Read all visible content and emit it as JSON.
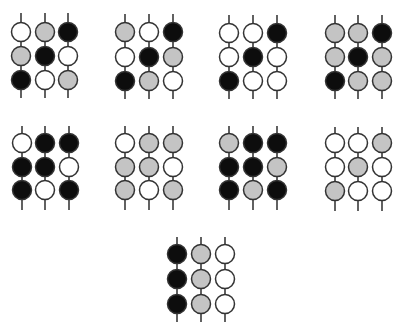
{
  "diagram": {
    "type": "bead-pattern-grid",
    "legend": {
      "W": {
        "name": "white",
        "color": "#ffffff"
      },
      "G": {
        "name": "gray",
        "color": "#c4c4c4"
      },
      "B": {
        "name": "black",
        "color": "#0d0d0d"
      }
    },
    "outline_color": "#333333",
    "bead_radius": 9.5,
    "panels": [
      {
        "id": 1,
        "x": [
          21,
          45,
          68
        ],
        "y": [
          32,
          56,
          80
        ],
        "rod": [
          13,
          98
        ],
        "rows": [
          [
            "W",
            "G",
            "B"
          ],
          [
            "G",
            "B",
            "W"
          ],
          [
            "B",
            "W",
            "G"
          ]
        ]
      },
      {
        "id": 2,
        "x": [
          125,
          149,
          173
        ],
        "y": [
          32,
          57,
          81
        ],
        "rod": [
          14,
          99
        ],
        "rows": [
          [
            "G",
            "W",
            "B"
          ],
          [
            "W",
            "B",
            "G"
          ],
          [
            "B",
            "G",
            "W"
          ]
        ]
      },
      {
        "id": 3,
        "x": [
          229,
          253,
          277
        ],
        "y": [
          33,
          57,
          81
        ],
        "rod": [
          15,
          99
        ],
        "rows": [
          [
            "W",
            "W",
            "B"
          ],
          [
            "W",
            "B",
            "W"
          ],
          [
            "B",
            "W",
            "W"
          ]
        ]
      },
      {
        "id": 4,
        "x": [
          335,
          358,
          382
        ],
        "y": [
          33,
          57,
          81
        ],
        "rod": [
          15,
          99
        ],
        "rows": [
          [
            "G",
            "G",
            "B"
          ],
          [
            "G",
            "B",
            "G"
          ],
          [
            "B",
            "G",
            "G"
          ]
        ]
      },
      {
        "id": 5,
        "x": [
          22,
          45,
          69
        ],
        "y": [
          143,
          167,
          190
        ],
        "rod": [
          126,
          210
        ],
        "rows": [
          [
            "W",
            "B",
            "B"
          ],
          [
            "B",
            "B",
            "W"
          ],
          [
            "B",
            "W",
            "B"
          ]
        ]
      },
      {
        "id": 6,
        "x": [
          125,
          149,
          173
        ],
        "y": [
          143,
          167,
          190
        ],
        "rod": [
          126,
          210
        ],
        "rows": [
          [
            "W",
            "G",
            "G"
          ],
          [
            "G",
            "G",
            "W"
          ],
          [
            "G",
            "W",
            "G"
          ]
        ]
      },
      {
        "id": 7,
        "x": [
          229,
          253,
          277
        ],
        "y": [
          143,
          167,
          190
        ],
        "rod": [
          126,
          210
        ],
        "rows": [
          [
            "G",
            "B",
            "B"
          ],
          [
            "B",
            "B",
            "G"
          ],
          [
            "B",
            "G",
            "B"
          ]
        ]
      },
      {
        "id": 8,
        "x": [
          335,
          358,
          382
        ],
        "y": [
          143,
          167,
          191
        ],
        "rod": [
          127,
          211
        ],
        "rows": [
          [
            "W",
            "W",
            "G"
          ],
          [
            "W",
            "G",
            "W"
          ],
          [
            "G",
            "W",
            "W"
          ]
        ]
      },
      {
        "id": 9,
        "x": [
          177,
          201,
          225
        ],
        "y": [
          254,
          279,
          304
        ],
        "rod": [
          237,
          322
        ],
        "rows": [
          [
            "B",
            "G",
            "W"
          ],
          [
            "B",
            "G",
            "W"
          ],
          [
            "B",
            "G",
            "W"
          ]
        ]
      }
    ]
  }
}
